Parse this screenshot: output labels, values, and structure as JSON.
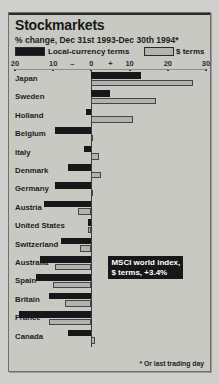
{
  "figure": {
    "title": "Stockmarkets",
    "subtitle": "% change, Dec 31st 1993-Dec 30th 1994*",
    "footnote": "* Or last trading day",
    "callout": "MSCI world index,\n$ terms, +3.4%"
  },
  "legend": {
    "dark_label": "Local-currency terms",
    "light_label": "$ terms"
  },
  "colors": {
    "panel": "#c9c9c4",
    "dark_series": "#17171a",
    "light_series": "#b3b3ae",
    "rule": "#2a2a28"
  },
  "chart_data": {
    "type": "bar",
    "orientation": "horizontal",
    "title": "Stockmarkets",
    "subtitle": "% change, Dec 31st 1993-Dec 30th 1994*",
    "xlabel": "% change",
    "ylabel": "",
    "xlim": [
      -20,
      30
    ],
    "ticks": [
      -20,
      -10,
      0,
      10,
      20,
      30
    ],
    "tick_labels": [
      "20",
      "10",
      "0",
      "10",
      "20",
      "30"
    ],
    "sign_markers": [
      "–",
      "+"
    ],
    "grid": false,
    "legend_position": "top",
    "categories": [
      "Japan",
      "Sweden",
      "Holland",
      "Belgium",
      "Italy",
      "Denmark",
      "Germany",
      "Austria",
      "United States",
      "Switzerland",
      "Australia",
      "Spain",
      "Britain",
      "France",
      "Canada"
    ],
    "series": [
      {
        "name": "Local-currency terms",
        "values": [
          13.0,
          5.0,
          -1.5,
          -9.5,
          -2.0,
          -6.0,
          -9.5,
          -12.5,
          -1.0,
          -8.0,
          -13.5,
          -14.5,
          -11.0,
          -19.0,
          -6.0
        ]
      },
      {
        "name": "$ terms",
        "values": [
          26.5,
          17.0,
          11.0,
          0.5,
          2.0,
          2.5,
          0.0,
          -3.5,
          -1.0,
          -3.0,
          -9.5,
          -10.0,
          -7.0,
          -11.0,
          1.0
        ]
      }
    ],
    "annotations": [
      {
        "text": "MSCI world index, $ terms, +3.4%",
        "value": 3.4
      }
    ]
  }
}
